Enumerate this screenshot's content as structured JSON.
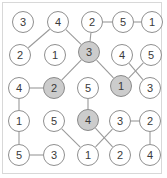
{
  "figure": {
    "width": 167,
    "height": 178,
    "background_color": "#ffffff",
    "frame_color": "#d8d8d8",
    "node_fill": "#ffffff",
    "node_shaded_fill": "#cccccc",
    "node_stroke": "#8f8f8f",
    "edge_color": "#9a9a9a",
    "label_color": "#3a3a3a"
  },
  "chart_data": {
    "type": "diagram",
    "rows": 5,
    "cols": 5,
    "nodes": [
      {
        "id": "r1c1",
        "row": 1,
        "col": 1,
        "label": "3",
        "x": 23,
        "y": 22,
        "shaded": false
      },
      {
        "id": "r1c2",
        "row": 1,
        "col": 2,
        "label": "4",
        "x": 58,
        "y": 22,
        "shaded": false
      },
      {
        "id": "r1c3",
        "row": 1,
        "col": 3,
        "label": "2",
        "x": 92,
        "y": 22,
        "shaded": false
      },
      {
        "id": "r1c4",
        "row": 1,
        "col": 4,
        "label": "5",
        "x": 123,
        "y": 22,
        "shaded": false
      },
      {
        "id": "r1c5",
        "row": 1,
        "col": 5,
        "label": "1",
        "x": 152,
        "y": 22,
        "shaded": false
      },
      {
        "id": "r2c1",
        "row": 2,
        "col": 1,
        "label": "2",
        "x": 20,
        "y": 55,
        "shaded": false
      },
      {
        "id": "r2c2",
        "row": 2,
        "col": 2,
        "label": "1",
        "x": 55,
        "y": 55,
        "shaded": false
      },
      {
        "id": "r2c3",
        "row": 2,
        "col": 3,
        "label": "3",
        "x": 89,
        "y": 52,
        "shaded": true
      },
      {
        "id": "r2c4",
        "row": 2,
        "col": 4,
        "label": "4",
        "x": 122,
        "y": 55,
        "shaded": false
      },
      {
        "id": "r2c5",
        "row": 2,
        "col": 5,
        "label": "5",
        "x": 151,
        "y": 55,
        "shaded": false
      },
      {
        "id": "r3c1",
        "row": 3,
        "col": 1,
        "label": "4",
        "x": 19,
        "y": 88,
        "shaded": false
      },
      {
        "id": "r3c2",
        "row": 3,
        "col": 2,
        "label": "2",
        "x": 54,
        "y": 88,
        "shaded": true
      },
      {
        "id": "r3c3",
        "row": 3,
        "col": 3,
        "label": "5",
        "x": 88,
        "y": 88,
        "shaded": false
      },
      {
        "id": "r3c4",
        "row": 3,
        "col": 4,
        "label": "1",
        "x": 121,
        "y": 86,
        "shaded": true
      },
      {
        "id": "r3c5",
        "row": 3,
        "col": 5,
        "label": "3",
        "x": 150,
        "y": 88,
        "shaded": false
      },
      {
        "id": "r4c1",
        "row": 4,
        "col": 1,
        "label": "1",
        "x": 19,
        "y": 121,
        "shaded": false
      },
      {
        "id": "r4c2",
        "row": 4,
        "col": 2,
        "label": "5",
        "x": 54,
        "y": 121,
        "shaded": false
      },
      {
        "id": "r4c3",
        "row": 4,
        "col": 3,
        "label": "4",
        "x": 88,
        "y": 120,
        "shaded": true
      },
      {
        "id": "r4c4",
        "row": 4,
        "col": 4,
        "label": "3",
        "x": 120,
        "y": 121,
        "shaded": false
      },
      {
        "id": "r4c5",
        "row": 4,
        "col": 5,
        "label": "2",
        "x": 150,
        "y": 121,
        "shaded": false
      },
      {
        "id": "r5c1",
        "row": 5,
        "col": 1,
        "label": "5",
        "x": 19,
        "y": 155,
        "shaded": false
      },
      {
        "id": "r5c2",
        "row": 5,
        "col": 2,
        "label": "3",
        "x": 54,
        "y": 155,
        "shaded": false
      },
      {
        "id": "r5c3",
        "row": 5,
        "col": 3,
        "label": "1",
        "x": 88,
        "y": 155,
        "shaded": false
      },
      {
        "id": "r5c4",
        "row": 5,
        "col": 4,
        "label": "2",
        "x": 120,
        "y": 155,
        "shaded": false
      },
      {
        "id": "r5c5",
        "row": 5,
        "col": 5,
        "label": "4",
        "x": 150,
        "y": 155,
        "shaded": false
      }
    ],
    "edges": [
      {
        "from": "r1c2",
        "to": "r2c1",
        "kind": "diagonal"
      },
      {
        "from": "r1c2",
        "to": "r2c3",
        "kind": "diagonal"
      },
      {
        "from": "r1c3",
        "to": "r1c4",
        "kind": "horizontal"
      },
      {
        "from": "r1c4",
        "to": "r1c5",
        "kind": "horizontal"
      },
      {
        "from": "r1c3",
        "to": "r2c3",
        "kind": "diagonal"
      },
      {
        "from": "r2c3",
        "to": "r3c2",
        "kind": "diagonal"
      },
      {
        "from": "r2c3",
        "to": "r3c4",
        "kind": "diagonal"
      },
      {
        "from": "r2c4",
        "to": "r3c5",
        "kind": "diagonal"
      },
      {
        "from": "r2c5",
        "to": "r3c4",
        "kind": "diagonal"
      },
      {
        "from": "r3c1",
        "to": "r3c2",
        "kind": "horizontal"
      },
      {
        "from": "r3c1",
        "to": "r4c1",
        "kind": "vertical"
      },
      {
        "from": "r3c3",
        "to": "r4c3",
        "kind": "vertical"
      },
      {
        "from": "r4c1",
        "to": "r5c1",
        "kind": "vertical"
      },
      {
        "from": "r4c2",
        "to": "r5c3",
        "kind": "diagonal"
      },
      {
        "from": "r4c3",
        "to": "r5c4",
        "kind": "diagonal"
      },
      {
        "from": "r4c4",
        "to": "r5c3",
        "kind": "diagonal"
      },
      {
        "from": "r4c4",
        "to": "r4c5",
        "kind": "horizontal"
      },
      {
        "from": "r4c5",
        "to": "r5c5",
        "kind": "vertical"
      },
      {
        "from": "r5c1",
        "to": "r5c2",
        "kind": "horizontal"
      }
    ]
  }
}
